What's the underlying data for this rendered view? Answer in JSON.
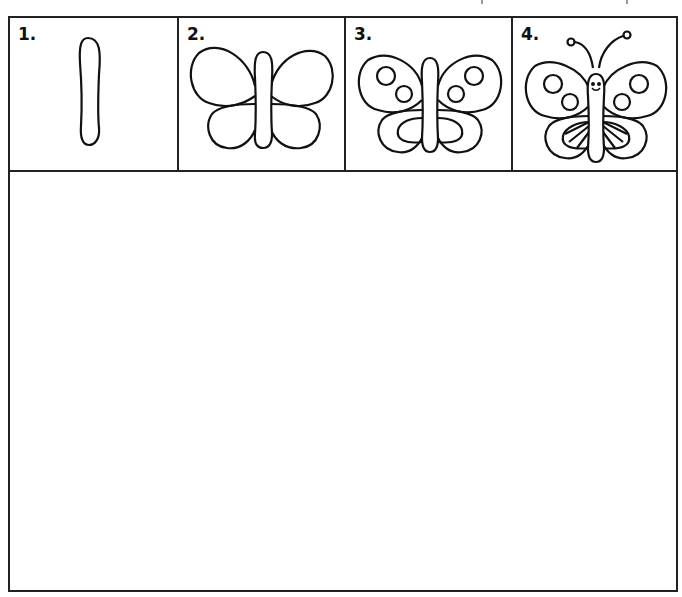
{
  "worksheet": {
    "title": "How to draw a butterfly",
    "steps": [
      {
        "number": "1.",
        "description": "body-oval"
      },
      {
        "number": "2.",
        "description": "wings-outline"
      },
      {
        "number": "3.",
        "description": "wing-spots-and-inner-lines"
      },
      {
        "number": "4.",
        "description": "antennae-face-and-stripes"
      }
    ],
    "drawing_area": {
      "label": ""
    },
    "colors": {
      "line": "#222222",
      "background": "#ffffff"
    }
  }
}
